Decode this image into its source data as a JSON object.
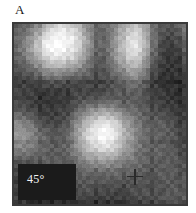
{
  "figure": {
    "panel_label": "A",
    "angle_annotation": "45°",
    "frame": {
      "border_color": "#3a3a3a",
      "background_color": "#ffffff",
      "inset_background": "#1b1b1b",
      "inset_text_color": "#f2f2f2",
      "label_color": "#161616"
    }
  },
  "chart_data": {
    "type": "heatmap",
    "title": "A",
    "subtitle": "",
    "xlabel": "",
    "ylabel": "",
    "annotations": [
      {
        "text": "A",
        "role": "panel-letter",
        "x": 16,
        "y": 10
      },
      {
        "text": "45°",
        "role": "angle-inset",
        "x": 33,
        "y": 186
      }
    ],
    "colormap": "grayscale",
    "grid": false,
    "legend": "none",
    "value_range": [
      0,
      255
    ],
    "grid_size": [
      22,
      23
    ],
    "markers": {
      "symbol": "cross",
      "count": 9,
      "points": [
        {
          "id": "m1",
          "x": 15.5,
          "y": 19.5,
          "color": "#2a2a2a",
          "size": 16
        },
        {
          "id": "m2",
          "x": 47.0,
          "y": 9.5,
          "color": "#2d2d2d",
          "size": 17
        },
        {
          "id": "m3",
          "x": 34.0,
          "y": 19.0,
          "color": "#8c8c8c",
          "size": 13
        },
        {
          "id": "m4",
          "x": 71.0,
          "y": 21.0,
          "color": "#303030",
          "size": 17
        },
        {
          "id": "m5",
          "x": 37.5,
          "y": 44.0,
          "color": "#2b2b2b",
          "size": 18
        },
        {
          "id": "m6",
          "x": 75.5,
          "y": 58.5,
          "color": "#c9c9c9",
          "size": 15
        },
        {
          "id": "m7",
          "x": 93.5,
          "y": 60.5,
          "color": "#3a3a3a",
          "size": 15
        },
        {
          "id": "m8",
          "x": 38.0,
          "y": 80.5,
          "color": "#b4b4b4",
          "size": 14
        },
        {
          "id": "m9",
          "x": 72.0,
          "y": 81.5,
          "color": "#cfcfcf",
          "size": 15
        }
      ]
    },
    "pixels": [
      [
        88,
        92,
        104,
        130,
        168,
        196,
        210,
        200,
        170,
        130,
        104,
        96,
        118,
        150,
        176,
        186,
        150,
        110,
        86,
        80,
        96,
        118
      ],
      [
        92,
        100,
        124,
        162,
        206,
        232,
        240,
        228,
        188,
        138,
        100,
        92,
        120,
        162,
        198,
        210,
        166,
        112,
        80,
        70,
        84,
        108
      ],
      [
        96,
        112,
        146,
        192,
        236,
        250,
        252,
        244,
        206,
        150,
        104,
        94,
        126,
        176,
        214,
        224,
        176,
        114,
        74,
        60,
        72,
        96
      ],
      [
        94,
        116,
        152,
        200,
        240,
        252,
        250,
        236,
        196,
        142,
        100,
        92,
        128,
        178,
        216,
        226,
        174,
        110,
        68,
        54,
        64,
        88
      ],
      [
        86,
        104,
        134,
        174,
        212,
        228,
        226,
        212,
        176,
        128,
        94,
        88,
        122,
        166,
        200,
        208,
        158,
        100,
        62,
        50,
        58,
        80
      ],
      [
        78,
        90,
        110,
        140,
        168,
        182,
        180,
        170,
        144,
        110,
        86,
        82,
        110,
        144,
        172,
        178,
        136,
        88,
        58,
        48,
        54,
        72
      ],
      [
        70,
        76,
        88,
        104,
        120,
        128,
        126,
        120,
        106,
        90,
        78,
        76,
        96,
        120,
        140,
        144,
        112,
        76,
        54,
        46,
        50,
        64
      ],
      [
        64,
        66,
        70,
        76,
        82,
        84,
        84,
        82,
        76,
        72,
        70,
        70,
        82,
        98,
        112,
        114,
        92,
        68,
        52,
        46,
        48,
        58
      ],
      [
        62,
        60,
        58,
        58,
        58,
        58,
        60,
        62,
        64,
        66,
        68,
        70,
        76,
        84,
        92,
        94,
        80,
        64,
        52,
        48,
        48,
        54
      ],
      [
        66,
        62,
        58,
        54,
        52,
        52,
        56,
        62,
        70,
        76,
        80,
        82,
        84,
        86,
        88,
        88,
        78,
        66,
        56,
        52,
        50,
        54
      ],
      [
        78,
        72,
        64,
        58,
        54,
        54,
        60,
        72,
        88,
        104,
        116,
        120,
        116,
        106,
        96,
        90,
        80,
        72,
        64,
        58,
        54,
        56
      ],
      [
        100,
        92,
        80,
        68,
        60,
        58,
        66,
        86,
        114,
        144,
        168,
        176,
        166,
        144,
        120,
        102,
        88,
        80,
        74,
        68,
        60,
        60
      ],
      [
        126,
        118,
        104,
        86,
        72,
        66,
        74,
        100,
        140,
        184,
        216,
        226,
        212,
        180,
        144,
        116,
        96,
        88,
        84,
        78,
        68,
        64
      ],
      [
        144,
        138,
        124,
        104,
        86,
        76,
        84,
        112,
        158,
        206,
        240,
        248,
        234,
        198,
        156,
        122,
        100,
        92,
        90,
        84,
        74,
        68
      ],
      [
        144,
        140,
        130,
        112,
        94,
        84,
        90,
        118,
        164,
        212,
        244,
        250,
        236,
        200,
        158,
        124,
        102,
        94,
        92,
        86,
        76,
        70
      ],
      [
        128,
        126,
        120,
        108,
        94,
        86,
        92,
        114,
        152,
        192,
        220,
        226,
        214,
        184,
        148,
        118,
        100,
        94,
        92,
        86,
        78,
        72
      ],
      [
        102,
        102,
        100,
        96,
        90,
        86,
        90,
        104,
        130,
        158,
        178,
        182,
        174,
        154,
        130,
        108,
        96,
        92,
        90,
        86,
        80,
        74
      ],
      [
        78,
        78,
        80,
        82,
        82,
        82,
        86,
        94,
        108,
        124,
        134,
        136,
        132,
        122,
        110,
        98,
        90,
        88,
        88,
        86,
        82,
        78
      ],
      [
        62,
        62,
        64,
        68,
        72,
        76,
        80,
        86,
        92,
        98,
        102,
        104,
        102,
        98,
        94,
        90,
        86,
        84,
        86,
        86,
        84,
        80
      ],
      [
        56,
        54,
        56,
        58,
        64,
        70,
        76,
        80,
        84,
        86,
        86,
        86,
        86,
        84,
        82,
        80,
        80,
        80,
        82,
        84,
        84,
        82
      ],
      [
        58,
        54,
        52,
        52,
        56,
        62,
        70,
        74,
        76,
        76,
        74,
        72,
        72,
        72,
        72,
        74,
        76,
        78,
        80,
        82,
        84,
        84
      ],
      [
        64,
        58,
        52,
        48,
        50,
        54,
        60,
        66,
        68,
        66,
        64,
        62,
        62,
        64,
        66,
        70,
        74,
        78,
        80,
        82,
        84,
        86
      ],
      [
        70,
        62,
        54,
        48,
        46,
        48,
        54,
        58,
        60,
        58,
        56,
        54,
        56,
        58,
        62,
        66,
        72,
        76,
        80,
        82,
        84,
        86
      ]
    ]
  }
}
